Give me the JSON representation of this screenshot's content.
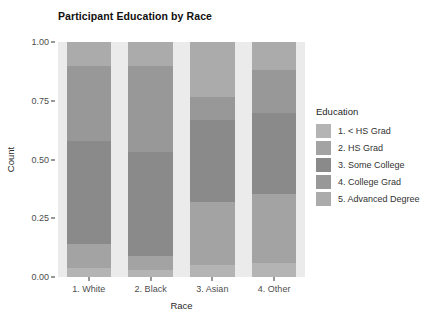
{
  "chart_data": {
    "type": "bar",
    "stacked": true,
    "orientation": "vertical",
    "title": "Participant Education by Race",
    "xlabel": "Race",
    "ylabel": "Count",
    "categories": [
      "1. White",
      "2. Black",
      "3. Asian",
      "4. Other"
    ],
    "ylim": [
      0,
      1
    ],
    "yticks": [
      "0.00",
      "0.25",
      "0.50",
      "0.75",
      "1.00"
    ],
    "ytick_values": [
      0,
      0.25,
      0.5,
      0.75,
      1
    ],
    "grid": false,
    "legend_position": "right",
    "legend_title": "Education",
    "series": [
      {
        "name": "1. < HS Grad",
        "color": "#b4b4b4",
        "values": [
          0.04,
          0.03,
          0.05,
          0.06
        ]
      },
      {
        "name": "2. HS Grad",
        "color": "#a3a3a3",
        "values": [
          0.1,
          0.06,
          0.27,
          0.295
        ]
      },
      {
        "name": "3. Some College",
        "color": "#8a8a8a",
        "values": [
          0.44,
          0.44,
          0.35,
          0.345
        ]
      },
      {
        "name": "4. College Grad",
        "color": "#989898",
        "values": [
          0.32,
          0.37,
          0.095,
          0.18
        ]
      },
      {
        "name": "5. Advanced Degree",
        "color": "#ababab",
        "values": [
          0.1,
          0.1,
          0.235,
          0.12
        ]
      }
    ],
    "panel_background": "#ebebeb",
    "figure_background": "#ffffff"
  }
}
